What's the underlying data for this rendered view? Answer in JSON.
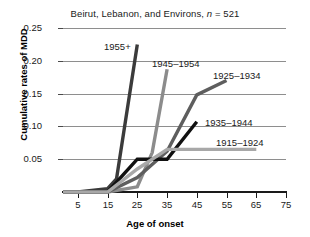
{
  "chart_data": {
    "type": "line",
    "title": "Beirut, Lebanon, and Environs, n = 521",
    "title_prefix": "Beirut, Lebanon, and Environs, ",
    "title_italic": "n",
    "title_suffix": " = 521",
    "xlabel": "Age of onset",
    "ylabel": "Cumulative rates of MDD",
    "xlim": [
      0,
      75
    ],
    "ylim": [
      0,
      0.25
    ],
    "xticks": [
      5,
      15,
      25,
      35,
      45,
      55,
      65,
      75
    ],
    "yticks": [
      0.05,
      0.1,
      0.15,
      0.2,
      0.25
    ],
    "ytick_labels": [
      "0.05",
      "0.10",
      "0.15",
      "0.20",
      "0.25"
    ],
    "grid": "horizontal",
    "legend": "inline-annotations",
    "series": [
      {
        "name": "1955+",
        "color": "#3b3b3b",
        "label_x": 104,
        "label_y": 41,
        "x": [
          0,
          5,
          15,
          18,
          25
        ],
        "y": [
          0.0,
          0.0,
          0.005,
          0.02,
          0.225
        ]
      },
      {
        "name": "1945–1954",
        "color": "#8c8c8c",
        "label_x": 152,
        "label_y": 58,
        "x": [
          0,
          5,
          15,
          25,
          30,
          35
        ],
        "y": [
          0.0,
          0.0,
          0.0,
          0.008,
          0.06,
          0.187
        ]
      },
      {
        "name": "1925–1934",
        "color": "#5e5e5e",
        "label_x": 213,
        "label_y": 70,
        "x": [
          0,
          5,
          15,
          25,
          35,
          45,
          55
        ],
        "y": [
          0.0,
          0.0,
          0.0,
          0.022,
          0.062,
          0.148,
          0.17
        ]
      },
      {
        "name": "1935–1944",
        "color": "#111111",
        "label_x": 205,
        "label_y": 117,
        "x": [
          0,
          5,
          15,
          25,
          35,
          45
        ],
        "y": [
          0.0,
          0.0,
          0.0,
          0.05,
          0.05,
          0.107
        ]
      },
      {
        "name": "1915–1924",
        "color": "#a8a8a8",
        "label_x": 216,
        "label_y": 137,
        "x": [
          0,
          5,
          15,
          25,
          35,
          65
        ],
        "y": [
          0.0,
          0.0,
          0.0,
          0.035,
          0.065,
          0.065
        ]
      }
    ]
  }
}
